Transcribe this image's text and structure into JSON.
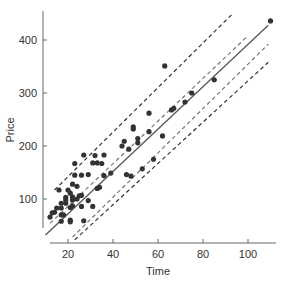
{
  "chart_data": {
    "type": "scatter",
    "title": "",
    "xlabel": "Time",
    "ylabel": "Price",
    "xlim": [
      12,
      112
    ],
    "ylim": [
      25,
      460
    ],
    "x_ticks": [
      20,
      40,
      60,
      80,
      100
    ],
    "y_ticks": [
      100,
      200,
      300,
      400
    ],
    "grid": false,
    "legend": null,
    "series": [
      {
        "name": "observations",
        "type": "scatter",
        "color": "#333333",
        "points": [
          [
            63,
            351
          ],
          [
            85,
            325
          ],
          [
            110,
            436
          ],
          [
            75,
            300
          ],
          [
            72,
            283
          ],
          [
            67,
            271
          ],
          [
            66,
            268
          ],
          [
            56,
            262
          ],
          [
            62,
            219
          ],
          [
            56,
            227
          ],
          [
            49,
            236
          ],
          [
            49,
            232
          ],
          [
            51,
            214
          ],
          [
            51,
            206
          ],
          [
            45,
            209
          ],
          [
            44,
            200
          ],
          [
            47,
            194
          ],
          [
            58,
            175
          ],
          [
            53,
            157
          ],
          [
            32,
            182
          ],
          [
            36,
            183
          ],
          [
            27,
            183
          ],
          [
            33,
            168
          ],
          [
            48,
            143
          ],
          [
            31,
            168
          ],
          [
            23,
            167
          ],
          [
            35,
            167
          ],
          [
            46,
            146
          ],
          [
            36,
            144
          ],
          [
            39,
            149
          ],
          [
            23,
            145
          ],
          [
            26,
            145
          ],
          [
            29,
            146
          ],
          [
            24,
            124
          ],
          [
            34,
            122
          ],
          [
            33,
            120
          ],
          [
            16,
            117
          ],
          [
            20,
            117
          ],
          [
            22,
            128
          ],
          [
            21,
            111
          ],
          [
            25,
            106
          ],
          [
            22,
            104
          ],
          [
            19,
            103
          ],
          [
            26,
            107
          ],
          [
            19,
            98
          ],
          [
            22,
            98
          ],
          [
            24,
            100
          ],
          [
            29,
            97
          ],
          [
            17,
            92
          ],
          [
            19,
            92
          ],
          [
            22,
            87
          ],
          [
            21,
            84
          ],
          [
            26,
            86
          ],
          [
            31,
            86
          ],
          [
            15,
            83
          ],
          [
            17,
            83
          ],
          [
            14,
            75
          ],
          [
            17,
            70
          ],
          [
            18,
            70
          ],
          [
            13,
            74
          ],
          [
            12,
            66
          ],
          [
            17,
            58
          ],
          [
            21,
            60
          ],
          [
            21,
            57
          ],
          [
            27,
            59
          ]
        ]
      },
      {
        "name": "regression line",
        "type": "line",
        "style": "solid",
        "color": "#555555",
        "points": [
          [
            10,
            32
          ],
          [
            109,
            428
          ]
        ]
      },
      {
        "name": "confidence band (upper)",
        "type": "line",
        "style": "dashed",
        "color": "#777777",
        "points": [
          [
            12,
            54
          ],
          [
            100,
            408
          ]
        ]
      },
      {
        "name": "confidence band (lower)",
        "type": "line",
        "style": "dashed",
        "color": "#777777",
        "points": [
          [
            22,
            28
          ],
          [
            109,
            392
          ]
        ]
      },
      {
        "name": "prediction band (upper)",
        "type": "line",
        "style": "dashed",
        "color": "#333333",
        "points": [
          [
            14,
            117
          ],
          [
            93,
            449
          ]
        ]
      },
      {
        "name": "prediction band (lower)",
        "type": "line",
        "style": "dashed",
        "color": "#333333",
        "points": [
          [
            23,
            23
          ],
          [
            109,
            358
          ]
        ]
      }
    ]
  },
  "axes": {
    "x_label": "Time",
    "y_label": "Price",
    "x_tick_labels": [
      "20",
      "40",
      "60",
      "80",
      "100"
    ],
    "y_tick_labels": [
      "100",
      "200",
      "300",
      "400"
    ]
  }
}
